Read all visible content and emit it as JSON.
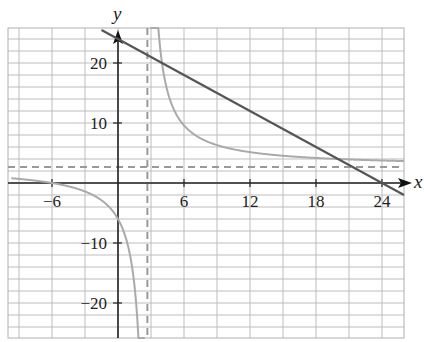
{
  "chart_data": {
    "type": "line",
    "title": "",
    "xlabel": "x",
    "ylabel": "y",
    "xlim": [
      -10,
      26
    ],
    "ylim": [
      -26,
      26
    ],
    "grid": true,
    "grid_spacing": {
      "x": 3,
      "y": 2
    },
    "x_ticks": [
      -6,
      6,
      12,
      18,
      24
    ],
    "x_tick_labels": [
      "−6",
      "6",
      "12",
      "18",
      "24"
    ],
    "y_ticks": [
      20,
      10,
      -10,
      -20
    ],
    "y_tick_labels": [
      "20",
      "10",
      "−10",
      "−20"
    ],
    "series": [
      {
        "name": "line",
        "description": "Straight line with slope -1 crossing x-axis at 24",
        "equation": "y = 24 - x",
        "color": "#555555",
        "style": "solid",
        "points": [
          [
            -1.5,
            25.5
          ],
          [
            24,
            0
          ],
          [
            26,
            -2
          ]
        ]
      },
      {
        "name": "rational",
        "description": "Rational function with vertical and horizontal asymptotes near 8/3",
        "equation": "y = (8x + 48) / (3x - 8)",
        "color": "#aaaaaa",
        "style": "solid",
        "x_intercept": -6,
        "y_intercept": -6
      }
    ],
    "asymptotes": [
      {
        "type": "vertical",
        "value": 2.67,
        "style": "dashed",
        "color": "#999999"
      },
      {
        "type": "horizontal",
        "value": 2.67,
        "style": "dashed",
        "color": "#999999"
      }
    ],
    "legend": null
  },
  "labels": {
    "x_axis": "x",
    "y_axis": "y",
    "x_ticks": [
      "−6",
      "6",
      "12",
      "18",
      "24"
    ],
    "y_ticks": [
      "20",
      "10",
      "−10",
      "−20"
    ]
  }
}
